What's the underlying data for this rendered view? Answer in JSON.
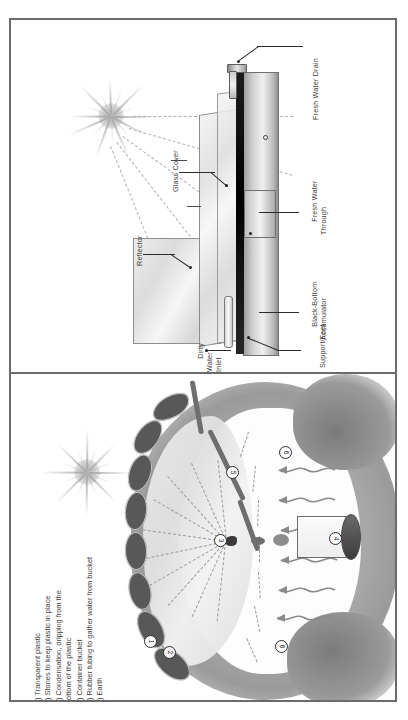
{
  "figure": {
    "orientation": "rotated-90-clockwise",
    "panels": [
      {
        "id": "solar-still",
        "name": "Basin solar still cross-section"
      },
      {
        "id": "earth-pit-still",
        "name": "Solar earth pit still"
      }
    ]
  },
  "solar_still": {
    "labels": {
      "fresh_water_drain": "Fresh Water Drain",
      "fresh_water_through": "Fresh Water\nThrough",
      "black_bottom_accumulator": "Black-Bottom\nAccumulator",
      "support_feet": "Support/Feet",
      "glass_cover": "Glass Cover",
      "reflector": "Reflector",
      "dirty_water_inlet": "Dirty\nWater\nInlet"
    }
  },
  "earth_pit_still": {
    "callouts": [
      {
        "n": "1"
      },
      {
        "n": "2"
      },
      {
        "n": "3"
      },
      {
        "n": "4"
      },
      {
        "n": "5"
      },
      {
        "n": "6"
      },
      {
        "n": "6"
      }
    ],
    "legend": [
      "1) Transparent plastic",
      "2) Stones to keep plastic in place",
      "3) Condensation, dripping from the",
      "      bottom of the plastic",
      "4) Container bucket",
      "5) Rubber tubing to gather water from bucket",
      "6) Earth"
    ]
  },
  "colors": {
    "frame": "#6b6b6b",
    "text": "#3e3e3e",
    "black_accumulator": "#000000",
    "stone": "#585858",
    "ground": "#9b9b9b",
    "paper": "#ffffff"
  }
}
